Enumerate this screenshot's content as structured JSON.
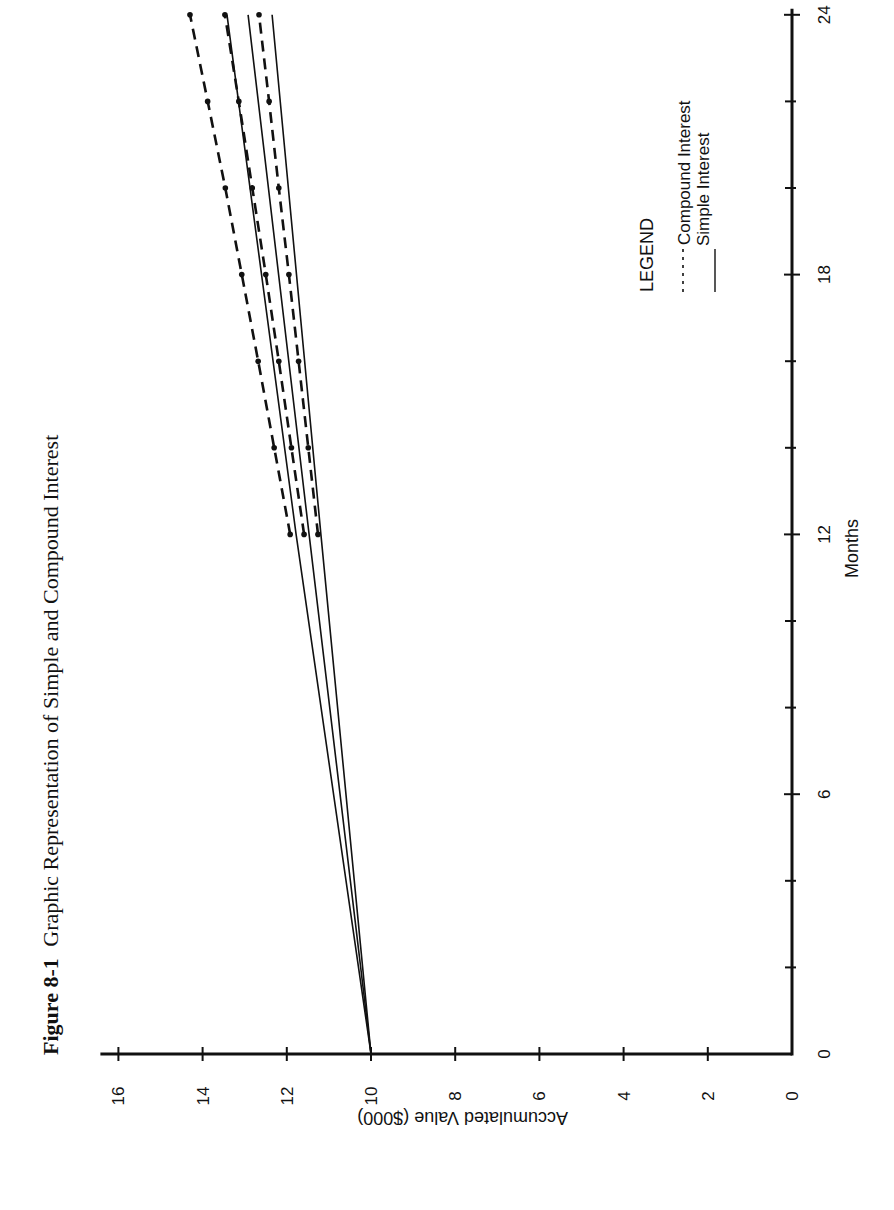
{
  "figure": {
    "number_label": "Figure 8-1",
    "title": "Graphic Representation of Simple and Compound Interest"
  },
  "chart_data": {
    "type": "line",
    "title": "Figure 8-1 Graphic Representation of Simple and Compound Interest",
    "xlabel": "Months",
    "ylabel": "Accumulated Value ($000)",
    "xlim": [
      0,
      24
    ],
    "ylim": [
      0,
      16
    ],
    "x_ticks": [
      0,
      6,
      12,
      18,
      24
    ],
    "x_minor_ticks": [
      2,
      4,
      8,
      10,
      14,
      16,
      20,
      22
    ],
    "y_ticks": [
      0,
      2,
      4,
      6,
      8,
      10,
      12,
      14,
      16
    ],
    "grid": false,
    "orientation": "rotated 90° clockwise on page",
    "legend": {
      "title": "LEGEND",
      "position": "upper-left of plot area (page upper-right)",
      "entries": [
        {
          "label": "Compound Interest",
          "style": "dashed"
        },
        {
          "label": "Simple Interest",
          "style": "solid"
        }
      ]
    },
    "series": [
      {
        "name": "Simple Interest (high rate)",
        "style": "solid",
        "x": [
          0,
          12,
          24
        ],
        "values": [
          10.0,
          11.78,
          13.42
        ]
      },
      {
        "name": "Simple Interest (mid rate)",
        "style": "solid",
        "x": [
          0,
          12,
          24
        ],
        "values": [
          10.0,
          11.47,
          12.92
        ]
      },
      {
        "name": "Simple Interest (low rate)",
        "style": "solid",
        "x": [
          0,
          12,
          24
        ],
        "values": [
          10.0,
          11.19,
          12.35
        ]
      },
      {
        "name": "Compound Interest (high rate)",
        "style": "dashed",
        "x": [
          12,
          14,
          16,
          18,
          20,
          22,
          24
        ],
        "values": [
          11.92,
          12.3,
          12.68,
          13.07,
          13.46,
          13.88,
          14.3
        ]
      },
      {
        "name": "Compound Interest (mid rate)",
        "style": "dashed",
        "x": [
          12,
          14,
          16,
          18,
          20,
          22,
          24
        ],
        "values": [
          11.59,
          11.89,
          12.19,
          12.5,
          12.82,
          13.14,
          13.47
        ]
      },
      {
        "name": "Compound Interest (low rate)",
        "style": "dashed",
        "x": [
          12,
          14,
          16,
          18,
          20,
          22,
          24
        ],
        "values": [
          11.26,
          11.49,
          11.72,
          11.95,
          12.19,
          12.42,
          12.66
        ]
      }
    ]
  },
  "colors": {
    "ink": "#111111",
    "background": "#ffffff"
  }
}
